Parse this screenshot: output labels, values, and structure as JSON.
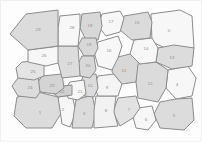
{
  "figure": {
    "type": "voronoi-tessellation",
    "background_color": "#fdfdfd",
    "border_color": "#8c8c8c",
    "label_color": "#8e8e8e",
    "fill_light": "#f7f7f7",
    "fill_mid": "#e9e9e9",
    "fill_dark": "#d8d8d8",
    "cell_count": 30,
    "width": 202,
    "height": 142
  },
  "chart_data": {
    "type": "diagram",
    "xlabel": "",
    "ylabel": "",
    "cells": [
      {
        "id": "0",
        "label": "0",
        "cx": 169,
        "cy": 31,
        "fill": "#f7f7f7",
        "points": "151,14 180,10 192,16 194,48 174,52 152,42"
      },
      {
        "id": "1",
        "label": "1",
        "cx": 40,
        "cy": 113,
        "fill": "#dcdcdc",
        "points": "17,97 38,92 58,97 62,112 52,128 26,128 14,116"
      },
      {
        "id": "2",
        "label": "2",
        "cx": 63,
        "cy": 110,
        "fill": "#f7f7f7",
        "points": "58,97 72,95 76,112 70,127 62,124 60,110"
      },
      {
        "id": "3",
        "label": "3",
        "cx": 84,
        "cy": 114,
        "fill": "#dcdcdc",
        "points": "76,100 92,95 96,112 92,128 72,128 74,112"
      },
      {
        "id": "4",
        "label": "4",
        "cx": 177,
        "cy": 85,
        "fill": "#f7f7f7",
        "points": "168,70 188,66 196,78 192,96 176,99 166,88"
      },
      {
        "id": "5",
        "label": "5",
        "cx": 174,
        "cy": 116,
        "fill": "#dcdcdc",
        "points": "160,102 176,99 192,98 194,120 184,130 160,128 154,114"
      },
      {
        "id": "6",
        "label": "6",
        "cx": 146,
        "cy": 120,
        "fill": "#f7f7f7",
        "points": "138,108 152,106 156,120 148,130 136,128 133,117"
      },
      {
        "id": "7",
        "label": "7",
        "cx": 129,
        "cy": 110,
        "fill": "#e2e2e2",
        "points": "118,98 136,96 140,108 133,118 120,126 113,112"
      },
      {
        "id": "8",
        "label": "8",
        "cx": 106,
        "cy": 111,
        "fill": "#f2f2f2",
        "points": "96,96 116,96 114,112 118,126 94,128 94,110"
      },
      {
        "id": "9",
        "label": "9",
        "cx": 107,
        "cy": 88,
        "fill": "#f4f4f4",
        "points": "98,76 114,74 122,84 118,96 98,96 94,86"
      },
      {
        "id": "10",
        "label": "10",
        "cx": 90,
        "cy": 86,
        "fill": "#dcdcdc",
        "points": "84,74 96,74 98,88 94,97 84,96 80,84"
      },
      {
        "id": "11",
        "label": "11",
        "cx": 124,
        "cy": 71,
        "fill": "#d8d8d8",
        "points": "114,58 130,54 140,64 136,82 122,84 112,72"
      },
      {
        "id": "12",
        "label": "12",
        "cx": 150,
        "cy": 84,
        "fill": "#dbdbdb",
        "points": "138,64 156,62 168,70 166,88 158,102 138,98 136,82"
      },
      {
        "id": "13",
        "label": "13",
        "cx": 172,
        "cy": 58,
        "fill": "#dcdcdc",
        "points": "158,48 174,45 194,48 192,66 172,69 156,62"
      },
      {
        "id": "14",
        "label": "14",
        "cx": 146,
        "cy": 49,
        "fill": "#f7f7f7",
        "points": "134,40 152,38 158,48 156,62 140,64 130,54"
      },
      {
        "id": "15",
        "label": "15",
        "cx": 137,
        "cy": 23,
        "fill": "#dbdbdb",
        "points": "124,16 148,12 152,22 150,38 132,40 120,30"
      },
      {
        "id": "16",
        "label": "16",
        "cx": 109,
        "cy": 51,
        "fill": "#f7f7f7",
        "points": "98,42 118,36 122,46 118,58 112,70 98,66 94,52"
      },
      {
        "id": "17",
        "label": "17",
        "cx": 111,
        "cy": 22,
        "fill": "#f7f7f7",
        "points": "102,14 120,11 124,18 120,32 106,36 98,26"
      },
      {
        "id": "18",
        "label": "18",
        "cx": 90,
        "cy": 26,
        "fill": "#d8d8d8",
        "points": "82,14 100,12 102,26 98,40 86,40 80,28"
      },
      {
        "id": "19",
        "label": "19",
        "cx": 89,
        "cy": 45,
        "fill": "#d8d8d8",
        "points": "82,38 96,38 98,48 94,56 84,56 78,46"
      },
      {
        "id": "20",
        "label": "20",
        "cx": 88,
        "cy": 66,
        "fill": "#d8d8d8",
        "points": "82,56 94,56 96,70 90,78 80,76 78,64"
      },
      {
        "id": "21",
        "label": "21",
        "cx": 80,
        "cy": 92,
        "fill": "#f7f7f7",
        "points": "70,82 84,80 86,94 78,100 68,98 66,88"
      },
      {
        "id": "22",
        "label": "22",
        "cx": 62,
        "cy": 92,
        "fill": "#d0d0d0",
        "points": "54,87 72,85 72,95 58,97 54,94"
      },
      {
        "id": "23",
        "label": "23",
        "cx": 52,
        "cy": 86,
        "fill": "#d4d4d4",
        "points": "42,76 62,74 64,88 56,94 40,92 38,82"
      },
      {
        "id": "24",
        "label": "24",
        "cx": 30,
        "cy": 88,
        "fill": "#dcdcdc",
        "points": "18,78 38,76 40,92 36,98 18,96 12,86"
      },
      {
        "id": "25",
        "label": "25",
        "cx": 33,
        "cy": 72,
        "fill": "#e4e4e4",
        "points": "22,62 44,60 44,76 34,80 18,78 16,68"
      },
      {
        "id": "26",
        "label": "26",
        "cx": 44,
        "cy": 56,
        "fill": "#f7f7f7",
        "points": "28,50 60,46 62,62 46,66 28,62"
      },
      {
        "id": "27",
        "label": "27",
        "cx": 70,
        "cy": 64,
        "fill": "#dcdcdc",
        "points": "58,46 78,46 80,76 62,78 58,62"
      },
      {
        "id": "28",
        "label": "28",
        "cx": 72,
        "cy": 28,
        "fill": "#f7f7f7",
        "points": "60,16 80,14 80,28 78,46 58,46 58,28"
      },
      {
        "id": "29",
        "label": "29",
        "cx": 38,
        "cy": 30,
        "fill": "#dcdcdc",
        "points": "26,14 58,10 58,46 28,50 10,34"
      }
    ]
  }
}
